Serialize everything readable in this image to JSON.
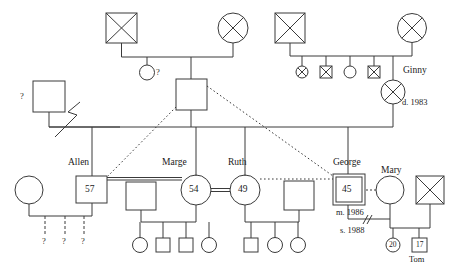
{
  "diagram": {
    "type": "genogram",
    "canvas": {
      "width": 453,
      "height": 267
    },
    "colors": {
      "stroke": "#3a3a3a",
      "text": "#1a1a1a",
      "background": "#ffffff"
    }
  },
  "generation_1": {
    "maternal_couple": {
      "father": {
        "shape": "square",
        "deceased": true,
        "label": "",
        "x": 122,
        "y": 28
      },
      "mother": {
        "shape": "circle",
        "deceased": true,
        "label": "",
        "x": 233,
        "y": 28
      },
      "children": [
        {
          "shape": "circle",
          "label": "?",
          "deceased": false,
          "x": 147,
          "y": 72
        },
        {
          "shape": "square",
          "label": "",
          "deceased": false,
          "x": 191,
          "y": 94
        }
      ]
    },
    "paternal_couple": {
      "father": {
        "shape": "square",
        "deceased": true,
        "label": "",
        "x": 290,
        "y": 28
      },
      "mother": {
        "shape": "circle",
        "deceased": true,
        "label": "",
        "x": 412,
        "y": 28
      },
      "children": [
        {
          "shape": "circle",
          "label": "",
          "deceased": true,
          "x": 302,
          "y": 72
        },
        {
          "shape": "square",
          "label": "",
          "deceased": true,
          "x": 326,
          "y": 72
        },
        {
          "shape": "circle",
          "label": "",
          "deceased": false,
          "x": 350,
          "y": 72
        },
        {
          "shape": "square",
          "label": "",
          "deceased": true,
          "x": 374,
          "y": 72
        },
        {
          "shape": "circle",
          "label": "Ginny",
          "note": "d. 1983",
          "deceased": true,
          "x": 393,
          "y": 92
        }
      ]
    }
  },
  "generation_2": {
    "left_unknown": {
      "shape": "square",
      "label": "?",
      "x": 50,
      "y": 97
    },
    "center_father": {
      "shape": "square",
      "label": "",
      "x": 191,
      "y": 94
    },
    "separation_mark": "zigzag"
  },
  "generation_3": {
    "allen": {
      "name": "Allen",
      "shape": "square",
      "age": "57",
      "x": 92,
      "y": 190
    },
    "allen_partner": {
      "shape": "circle",
      "label": "",
      "x": 29,
      "y": 190
    },
    "allen_children": [
      {
        "label": "?",
        "x": 45
      },
      {
        "label": "?",
        "x": 65
      },
      {
        "label": "?",
        "x": 84
      }
    ],
    "marge": {
      "name": "Marge",
      "shape": "circle",
      "age": "54",
      "x": 196,
      "y": 190
    },
    "marge_partner": {
      "shape": "square",
      "label": "",
      "x": 141,
      "y": 190
    },
    "marge_children": [
      {
        "shape": "circle",
        "x": 140
      },
      {
        "shape": "square",
        "x": 163
      },
      {
        "shape": "square",
        "x": 186
      },
      {
        "shape": "circle",
        "x": 209
      }
    ],
    "ruth": {
      "name": "Ruth",
      "shape": "circle",
      "age": "49",
      "x": 245,
      "y": 190
    },
    "ruth_partner": {
      "shape": "square",
      "label": "",
      "x": 299,
      "y": 190
    },
    "ruth_children": [
      {
        "shape": "square",
        "x": 251
      },
      {
        "shape": "circle",
        "x": 275
      },
      {
        "shape": "circle",
        "x": 298
      }
    ],
    "george": {
      "name": "George",
      "shape": "square",
      "age": "45",
      "index_person": true,
      "x": 348,
      "y": 190,
      "marriage_note": "m. 1986",
      "separation_note": "s. 1988"
    },
    "mary": {
      "name": "Mary",
      "shape": "circle",
      "label": "",
      "x": 390,
      "y": 190
    },
    "mary_partner": {
      "shape": "square",
      "deceased": true,
      "label": "",
      "x": 430,
      "y": 190
    }
  },
  "generation_4": {
    "children": [
      {
        "shape": "circle",
        "age": "20",
        "label": "",
        "x": 393,
        "y": 244
      },
      {
        "shape": "square",
        "age": "17",
        "label": "Tom",
        "x": 419,
        "y": 244
      }
    ]
  },
  "labels": {
    "allen": "Allen",
    "marge": "Marge",
    "ruth": "Ruth",
    "george": "George",
    "mary": "Mary",
    "ginny": "Ginny",
    "ginny_death": "d. 1983",
    "marriage_year": "m. 1986",
    "separation_year": "s. 1988",
    "tom": "Tom",
    "unknown": "?",
    "age_allen": "57",
    "age_marge": "54",
    "age_ruth": "49",
    "age_george": "45",
    "age_child_20": "20",
    "age_child_17": "17"
  }
}
